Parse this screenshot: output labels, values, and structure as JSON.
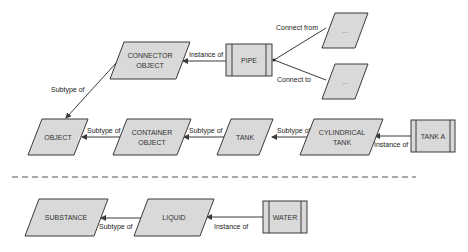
{
  "diagram": {
    "type": "ontology-diagram",
    "nodes": {
      "connector_object": {
        "line1": "CONNECTOR",
        "line2": "OBJECT",
        "shape": "parallelogram"
      },
      "pipe": {
        "label": "PIPE",
        "shape": "instance-box"
      },
      "connect_from_target": {
        "label": "...",
        "shape": "parallelogram"
      },
      "connect_to_target": {
        "label": "...",
        "shape": "parallelogram"
      },
      "object": {
        "label": "OBJECT",
        "shape": "parallelogram"
      },
      "container_object": {
        "line1": "CONTAINER",
        "line2": "OBJECT",
        "shape": "parallelogram"
      },
      "tank": {
        "label": "TANK",
        "shape": "parallelogram"
      },
      "cylindrical_tank": {
        "line1": "CYLINDRICAL",
        "line2": "TANK",
        "shape": "parallelogram"
      },
      "tank_a": {
        "label": "TANK A",
        "shape": "instance-box"
      },
      "substance": {
        "label": "SUBSTANCE",
        "shape": "parallelogram"
      },
      "liquid": {
        "label": "LIQUID",
        "shape": "parallelogram"
      },
      "water": {
        "label": "WATER",
        "shape": "instance-box"
      }
    },
    "edges": {
      "pipe_to_connector": {
        "from": "PIPE",
        "to": "CONNECTOR OBJECT",
        "label": "Instance of"
      },
      "pipe_connect_from": {
        "from": "PIPE",
        "to": "...",
        "label": "Connect from"
      },
      "pipe_connect_to": {
        "from": "PIPE",
        "to": "...",
        "label": "Connect to"
      },
      "connector_to_object": {
        "from": "CONNECTOR OBJECT",
        "to": "OBJECT",
        "label": "Subtype of"
      },
      "container_to_object": {
        "from": "CONTAINER OBJECT",
        "to": "OBJECT",
        "label": "Subtype of"
      },
      "tank_to_container": {
        "from": "TANK",
        "to": "CONTAINER OBJECT",
        "label": "Subtype of"
      },
      "cyl_to_tank": {
        "from": "CYLINDRICAL TANK",
        "to": "TANK",
        "label": "Subtype of"
      },
      "tanka_to_cyl": {
        "from": "TANK A",
        "to": "CYLINDRICAL TANK",
        "label": "Instance of"
      },
      "liquid_to_substance": {
        "from": "LIQUID",
        "to": "SUBSTANCE",
        "label": "Subtype of"
      },
      "water_to_liquid": {
        "from": "WATER",
        "to": "LIQUID",
        "label": "Instance of"
      }
    },
    "colors": {
      "fill": "#d9d9d9",
      "stroke": "#3a3a3a",
      "text": "#333333"
    }
  }
}
